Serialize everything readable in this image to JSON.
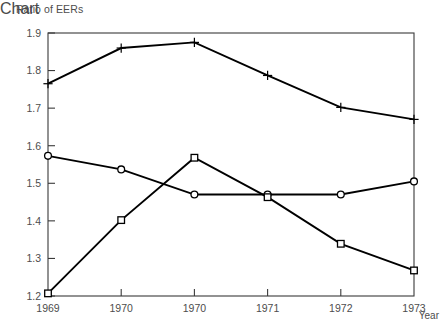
{
  "chart_data": {
    "type": "line",
    "title": "Ratio of EERs",
    "xlabel": "Year",
    "ylabel": "Ratio of EERs",
    "categories": [
      "1969",
      "1970",
      "1970",
      "1971",
      "1972",
      "1973"
    ],
    "x_tick_labels": [
      "1969",
      "1970",
      "1970",
      "1971",
      "1972",
      "1973"
    ],
    "y_tick_labels": [
      "1.2",
      "1.3",
      "1.4",
      "1.5",
      "1.6",
      "1.7",
      "1.8",
      "1.9"
    ],
    "y_tick_values": [
      1.2,
      1.3,
      1.4,
      1.5,
      1.6,
      1.7,
      1.8,
      1.9
    ],
    "ylim": [
      1.2,
      1.9
    ],
    "grid": false,
    "legend": "none",
    "line_color": "#000000",
    "axis_color": "#3a3a3a",
    "series": [
      {
        "name": "series-plus",
        "marker": "plus",
        "values": [
          1.765,
          1.86,
          1.875,
          1.787,
          1.702,
          1.67
        ]
      },
      {
        "name": "series-circle",
        "marker": "circle",
        "values": [
          1.573,
          1.537,
          1.47,
          1.47,
          1.47,
          1.505
        ]
      },
      {
        "name": "series-square",
        "marker": "square",
        "values": [
          1.207,
          1.402,
          1.568,
          1.463,
          1.339,
          1.268
        ]
      }
    ]
  }
}
